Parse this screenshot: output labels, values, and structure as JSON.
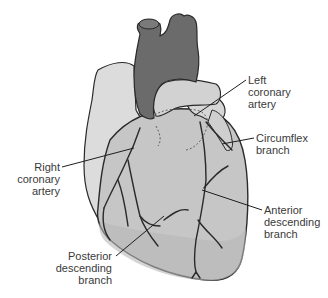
{
  "diagram": {
    "colors": {
      "background": "#ffffff",
      "great_vessels": "#6b6b6b",
      "atria": "#d8d8d8",
      "ventricles": "#c4c4c4",
      "outline": "#2a2a2a",
      "label_text": "#3a3a3a",
      "leader_line": "#1e1e1e"
    },
    "labels": {
      "left_coronary_artery": [
        "Left",
        "coronary",
        "artery"
      ],
      "circumflex_branch": [
        "Circumflex",
        "branch"
      ],
      "right_coronary_artery": [
        "Right",
        "coronary",
        "artery"
      ],
      "anterior_descending_branch": [
        "Anterior",
        "descending",
        "branch"
      ],
      "posterior_descending_branch": [
        "Posterior",
        "descending",
        "branch"
      ]
    }
  }
}
